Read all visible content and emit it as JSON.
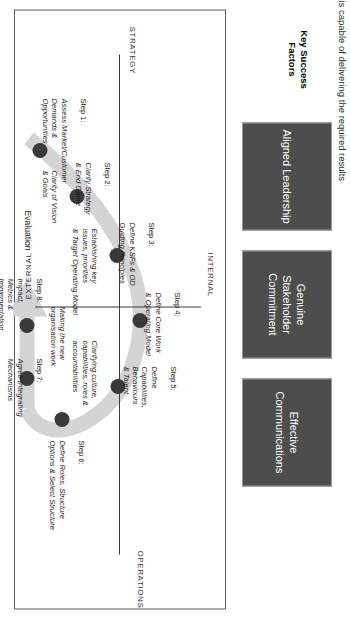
{
  "page": {
    "clipped_caption": "is capable of delivering the required results"
  },
  "ksf": {
    "title": "Key Success\nFactors",
    "boxes": [
      {
        "label": "Aligned\nLeadership"
      },
      {
        "label": "Genuine\nStakeholder\nCommitment"
      },
      {
        "label": "Effective\nCommunications"
      }
    ],
    "box_color": "#4d4d4d",
    "box_text_color": "#ffffff"
  },
  "axes": {
    "internal": "INTERNAL",
    "external": "EXTERNAL",
    "strategy": "STRATEGY",
    "operations": "OPERATIONS"
  },
  "steps": [
    {
      "number": "Step 1:",
      "text": "Assess Market/Customer\nDemands &\nOpportunities"
    },
    {
      "number": "Step 2:",
      "text": "Clarify Strategy\n& End Game"
    },
    {
      "number": "Step 3:",
      "text": "Define KSFs & OD\nGuiding Principles"
    },
    {
      "number": "Step 4:",
      "text": "Define Core Work\n& Operating Model"
    },
    {
      "number": "Step 5:",
      "text": "Define\nCapabilities,\nBehaviours\n& Talent"
    },
    {
      "number": "Step 6:",
      "text": "Define Roles, Structure\nOptions & Select Structure"
    },
    {
      "number": "Step 7:",
      "text": "Agree Integrating\nMechanisms"
    },
    {
      "number": "Step 8:",
      "text": "Impact,\nMetrics &\nImplementation"
    }
  ],
  "annotations": [
    {
      "text": "Clarity of Vision\n& Goals"
    },
    {
      "text": "Establishing key\nissues, priorities\n& Target Operating Model"
    },
    {
      "text": "Clarifying culture,\ncapabilities, roles &\naccountabilities"
    },
    {
      "text": "Making the new\norganisation work"
    }
  ],
  "evaluation_label": "Evaluation",
  "colors": {
    "band": "#d4d4d4",
    "dot": "#3a3a3a",
    "frame": "#5a5a5a",
    "axis": "#3a3a3a"
  }
}
